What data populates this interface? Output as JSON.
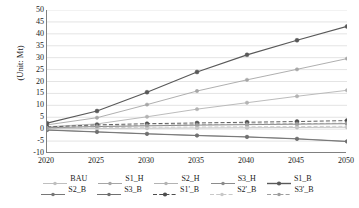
{
  "chart_data": {
    "type": "line",
    "title": "",
    "xlabel": "",
    "ylabel": "(Unit: Mt)",
    "x": [
      2020,
      2025,
      2030,
      2035,
      2040,
      2045,
      2050
    ],
    "xlim": [
      2020,
      2050
    ],
    "ylim": [
      -10,
      50
    ],
    "yticks": [
      -10,
      -5,
      0,
      5,
      10,
      15,
      20,
      25,
      30,
      35,
      40,
      45,
      50
    ],
    "xticks": [
      2020,
      2025,
      2030,
      2035,
      2040,
      2045,
      2050
    ],
    "grid": true,
    "grid_axis": "y",
    "legend_position": "bottom",
    "series": [
      {
        "name": "BAU",
        "color": "#bfbfbf",
        "dash": "solid",
        "marker": "circle",
        "values": [
          0.2,
          0.3,
          0.4,
          0.5,
          0.6,
          0.7,
          0.8
        ]
      },
      {
        "name": "S1_H",
        "color": "#a6a6a6",
        "dash": "solid",
        "marker": "circle",
        "values": [
          1.8,
          4.8,
          10.3,
          16.0,
          20.7,
          25.1,
          29.6
        ]
      },
      {
        "name": "S2_H",
        "color": "#b3b3b3",
        "dash": "solid",
        "marker": "circle",
        "values": [
          1.0,
          2.2,
          5.2,
          8.4,
          11.1,
          13.8,
          16.3
        ]
      },
      {
        "name": "S3_H",
        "color": "#8c8c8c",
        "dash": "solid",
        "marker": "circle",
        "values": [
          -0.3,
          -1.1,
          -1.9,
          -2.6,
          -3.2,
          -4.0,
          -5.1
        ]
      },
      {
        "name": "S1_B",
        "color": "#595959",
        "dash": "solid",
        "marker": "circle-filled",
        "values": [
          2.5,
          7.6,
          15.5,
          24.0,
          31.2,
          37.3,
          43.1
        ]
      },
      {
        "name": "S2_B",
        "color": "#777777",
        "dash": "solid",
        "marker": "circle",
        "values": [
          0.6,
          1.1,
          1.4,
          1.7,
          1.9,
          2.1,
          2.3
        ]
      },
      {
        "name": "S3_B",
        "color": "#707070",
        "dash": "solid",
        "marker": "circle",
        "values": [
          -0.4,
          -1.2,
          -2.0,
          -2.7,
          -3.3,
          -4.1,
          -5.2
        ]
      },
      {
        "name": "S1'_B",
        "color": "#4d4d4d",
        "dash": "dashed",
        "marker": "circle-filled",
        "values": [
          0.9,
          1.8,
          2.3,
          2.6,
          2.9,
          3.2,
          3.6
        ]
      },
      {
        "name": "S2'_B",
        "color": "#c8c8c8",
        "dash": "dashed",
        "marker": "circle",
        "values": [
          0.3,
          0.6,
          0.8,
          0.9,
          1.0,
          1.1,
          1.2
        ]
      },
      {
        "name": "S3'_B",
        "color": "#9e9e9e",
        "dash": "dashed",
        "marker": "circle",
        "values": [
          0.5,
          1.2,
          1.6,
          1.9,
          2.1,
          2.3,
          2.5
        ]
      }
    ]
  },
  "axis": {
    "y_title": "(Unit: Mt)",
    "y_labels": [
      "50",
      "45",
      "40",
      "35",
      "30",
      "25",
      "20",
      "15",
      "10",
      "5",
      "0",
      "-5",
      "-10"
    ],
    "x_labels": [
      "2020",
      "2025",
      "2030",
      "2035",
      "2040",
      "2045",
      "2050"
    ]
  },
  "legend": {
    "row1": [
      "BAU",
      "S1_H",
      "S2_H",
      "S3_H",
      "S1_B"
    ],
    "row2": [
      "S2_B",
      "S3_B",
      "S1'_B",
      "S2'_B",
      "S3'_B"
    ]
  },
  "colors": {
    "axis": "#808080",
    "grid": "#d9d9d9",
    "text": "#1a1a1a",
    "background": "#ffffff"
  }
}
